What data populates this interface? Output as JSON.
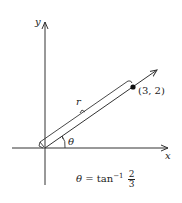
{
  "diagram": {
    "axes": {
      "x_label": "x",
      "y_label": "y"
    },
    "point": {
      "label": "(3, 2)",
      "x": 3,
      "y": 2
    },
    "vector_label": "r",
    "angle_label": "θ",
    "equation": {
      "lhs": "θ",
      "equals": "=",
      "func": "tan",
      "exponent": "−1",
      "numerator": "2",
      "denominator": "3"
    },
    "colors": {
      "line": "#333333",
      "background": "#ffffff"
    }
  }
}
